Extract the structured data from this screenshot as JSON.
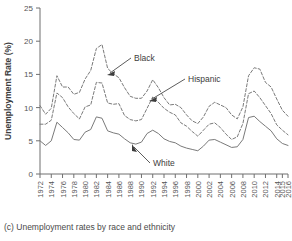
{
  "caption": "(c) Unemployment rates by race and ethnicity",
  "axes": {
    "ylabel": "Unemployment Rate (%)",
    "xlabel": "Year",
    "yticks": [
      "0",
      "5",
      "10",
      "15",
      "20",
      "25"
    ],
    "xticks": [
      "1972",
      "1974",
      "1976",
      "1978",
      "1980",
      "1982",
      "1984",
      "1986",
      "1988",
      "1990",
      "1992",
      "1994",
      "1996",
      "1998",
      "2000",
      "2002",
      "2004",
      "2006",
      "2008",
      "2010",
      "2012",
      "2014",
      "2015",
      "2016"
    ]
  },
  "annotations": [
    {
      "name": "black",
      "label": "Black"
    },
    {
      "name": "hispanic",
      "label": "Hispanic"
    },
    {
      "name": "white",
      "label": "White"
    }
  ],
  "chart_data": {
    "type": "line",
    "title": "",
    "xlabel": "Year",
    "ylabel": "Unemployment Rate (%)",
    "ylim": [
      0,
      25
    ],
    "xlim": [
      1972,
      2016
    ],
    "grid": false,
    "legend": "inline-annotations",
    "tick_labels_x": [
      "1972",
      "1974",
      "1976",
      "1978",
      "1980",
      "1982",
      "1984",
      "1986",
      "1988",
      "1990",
      "1992",
      "1994",
      "1996",
      "1998",
      "2000",
      "2002",
      "2004",
      "2006",
      "2008",
      "2010",
      "2012",
      "2014",
      "2015",
      "2016"
    ],
    "tick_labels_y": [
      "0",
      "5",
      "10",
      "15",
      "20",
      "25"
    ],
    "x": [
      1972,
      1973,
      1974,
      1975,
      1976,
      1977,
      1978,
      1979,
      1980,
      1981,
      1982,
      1983,
      1984,
      1985,
      1986,
      1987,
      1988,
      1989,
      1990,
      1991,
      1992,
      1993,
      1994,
      1995,
      1996,
      1997,
      1998,
      1999,
      2000,
      2001,
      2002,
      2003,
      2004,
      2005,
      2006,
      2007,
      2008,
      2009,
      2010,
      2011,
      2012,
      2013,
      2014,
      2015,
      2016
    ],
    "series": [
      {
        "name": "Black",
        "style": "dashed",
        "color": "#7a7a7a",
        "values": [
          10.3,
          9.0,
          9.9,
          14.8,
          13.1,
          13.1,
          12.0,
          12.3,
          14.3,
          15.6,
          18.9,
          19.5,
          15.9,
          15.1,
          14.5,
          13.0,
          11.7,
          11.4,
          11.4,
          12.5,
          14.2,
          13.0,
          11.5,
          10.4,
          10.5,
          10.0,
          8.9,
          8.0,
          7.6,
          8.6,
          10.2,
          10.8,
          10.4,
          10.0,
          8.9,
          8.3,
          10.1,
          14.8,
          16.0,
          15.8,
          13.8,
          13.1,
          11.3,
          9.6,
          8.7
        ]
      },
      {
        "name": "Hispanic",
        "style": "dashed",
        "color": "#7a7a7a",
        "values": [
          7.5,
          7.5,
          8.1,
          12.2,
          11.5,
          10.1,
          9.1,
          8.3,
          10.1,
          10.4,
          13.8,
          13.7,
          10.7,
          10.5,
          10.6,
          8.8,
          8.2,
          8.0,
          8.2,
          9.9,
          11.6,
          10.8,
          9.9,
          9.3,
          8.9,
          7.7,
          7.2,
          6.4,
          5.7,
          6.6,
          7.5,
          7.7,
          7.0,
          6.0,
          5.2,
          5.6,
          7.6,
          12.1,
          12.5,
          11.5,
          10.3,
          9.1,
          7.4,
          6.6,
          5.9
        ]
      },
      {
        "name": "White",
        "style": "solid",
        "color": "#7a7a7a",
        "values": [
          5.0,
          4.3,
          5.0,
          7.8,
          7.0,
          6.2,
          5.2,
          5.1,
          6.3,
          6.7,
          8.6,
          8.4,
          6.5,
          6.2,
          6.0,
          5.3,
          4.7,
          4.5,
          4.8,
          6.1,
          6.6,
          6.1,
          5.3,
          4.9,
          4.7,
          4.2,
          3.9,
          3.7,
          3.5,
          4.2,
          5.1,
          5.2,
          4.8,
          4.4,
          4.0,
          4.1,
          5.2,
          8.5,
          8.7,
          7.9,
          7.2,
          6.5,
          5.3,
          4.6,
          4.3
        ]
      }
    ]
  }
}
